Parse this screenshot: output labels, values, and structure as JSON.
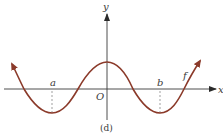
{
  "figure": {
    "caption": "(d)",
    "axes": {
      "x_label": "x",
      "y_label": "y",
      "origin_label": "O"
    },
    "curve": {
      "label": "f",
      "color": "#8b3a2a",
      "shape": "cosine-like wave with local max at x=0 and local minima at x=a and x=b; arrows at both ends"
    },
    "points": [
      {
        "label": "a",
        "role": "local minimum (left of origin)"
      },
      {
        "label": "b",
        "role": "local minimum (right of origin)"
      }
    ],
    "colors": {
      "axis": "#3a3a3a",
      "curve": "#8b3a2a",
      "dashed": "#777777"
    }
  }
}
